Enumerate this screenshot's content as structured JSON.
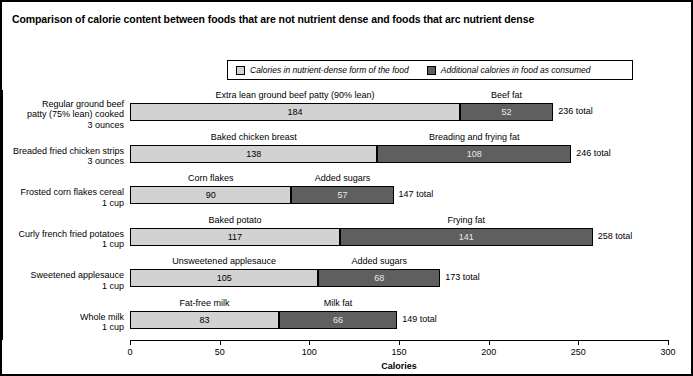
{
  "title": "Comparison of calorie content between foods that are not nutrient dense and foods that arc nutrient dense",
  "legend": {
    "items": [
      {
        "label": "Calories in nutrient-dense form of the food",
        "swatch": "light-gray-swatch",
        "color": "#d2d2d2"
      },
      {
        "label": "Additional calories in food as consumed",
        "swatch": "dark-gray-swatch",
        "color": "#5f5f5f"
      }
    ]
  },
  "chart_data": {
    "type": "bar",
    "orientation": "horizontal",
    "stacked": true,
    "title": "Comparison of calorie content between foods that are not nutrient dense and foods that arc nutrient dense",
    "xlabel": "Calories",
    "ylabel": "",
    "xlim": [
      0,
      300
    ],
    "xticks": [
      0,
      50,
      100,
      150,
      200,
      250,
      300
    ],
    "xticklabels": [
      "0",
      "50",
      "100",
      "150",
      "200",
      "250",
      "300"
    ],
    "grid": false,
    "legend_position": "top-center",
    "series": [
      {
        "name": "Calories in nutrient-dense form of the food",
        "color": "#d2d2d2",
        "values": [
          184,
          138,
          90,
          117,
          105,
          83
        ]
      },
      {
        "name": "Additional calories in food as consumed",
        "color": "#5f5f5f",
        "values": [
          52,
          108,
          57,
          141,
          68,
          66
        ]
      }
    ],
    "categories": [
      "Regular ground beef patty (75% lean) cooked 3 ounces",
      "Breaded fried chicken strips 3 ounces",
      "Frosted corn flakes cereal 1 cup",
      "Curly french fried potatoes 1 cup",
      "Sweetened applesauce 1 cup",
      "Whole milk 1 cup"
    ],
    "totals": [
      236,
      246,
      147,
      258,
      173,
      149
    ],
    "rows": [
      {
        "category_lines": [
          "Regular ground beef",
          "patty (75% lean) cooked",
          "3 ounces"
        ],
        "base_label": "Extra lean ground beef patty (90% lean)",
        "base_value": "184",
        "add_label": "Beef fat",
        "add_value": "52",
        "total_label": "236 total"
      },
      {
        "category_lines": [
          "Breaded fried chicken strips",
          "3 ounces"
        ],
        "base_label": "Baked chicken breast",
        "base_value": "138",
        "add_label": "Breading and frying fat",
        "add_value": "108",
        "total_label": "246 total"
      },
      {
        "category_lines": [
          "Frosted corn flakes cereal",
          "1 cup"
        ],
        "base_label": "Corn flakes",
        "base_value": "90",
        "add_label": "Added sugars",
        "add_value": "57",
        "total_label": "147 total"
      },
      {
        "category_lines": [
          "Curly french fried potatoes",
          "1 cup"
        ],
        "base_label": "Baked potato",
        "base_value": "117",
        "add_label": "Frying fat",
        "add_value": "141",
        "total_label": "258 total"
      },
      {
        "category_lines": [
          "Sweetened applesauce",
          "1 cup"
        ],
        "base_label": "Unsweetened applesauce",
        "base_value": "105",
        "add_label": "Added sugars",
        "add_value": "68",
        "total_label": "173 total"
      },
      {
        "category_lines": [
          "Whole milk",
          "1 cup"
        ],
        "base_label": "Fat-free milk",
        "base_value": "83",
        "add_label": "Milk fat",
        "add_value": "66",
        "total_label": "149 total"
      }
    ]
  }
}
